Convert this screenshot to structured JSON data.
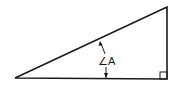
{
  "diagram": {
    "type": "right-triangle",
    "angle_label": "∠A",
    "stroke_color": "#1a1a1a",
    "background": "#ffffff",
    "vertices": {
      "left": [
        15,
        78
      ],
      "right_angle": [
        167,
        79
      ],
      "top": [
        167,
        7
      ]
    },
    "right_angle_marker_size": 7
  }
}
